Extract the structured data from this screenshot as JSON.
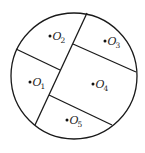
{
  "diagram": {
    "title": "",
    "canvas": {
      "width": 145,
      "height": 153,
      "background": "#ffffff"
    },
    "stroke_color": "#1a1a1a",
    "circle": {
      "cx": 74,
      "cy": 76,
      "r": 63
    },
    "partitions": [
      {
        "id": "main-diagonal",
        "x1": 35,
        "y1": 125,
        "x2": 87,
        "y2": 13
      },
      {
        "id": "o1-o2-divider",
        "x1": 16,
        "y1": 49,
        "x2": 60,
        "y2": 70
      },
      {
        "id": "o3-o4-divider",
        "x1": 73,
        "y1": 44,
        "x2": 136,
        "y2": 72
      },
      {
        "id": "o4-o5-divider",
        "x1": 49,
        "y1": 95,
        "x2": 112,
        "y2": 125
      }
    ],
    "regions": [
      {
        "id": "O1",
        "letter": "O",
        "subscript": "1",
        "dot": {
          "x": 30,
          "y": 82
        }
      },
      {
        "id": "O2",
        "letter": "O",
        "subscript": "2",
        "dot": {
          "x": 50,
          "y": 36
        }
      },
      {
        "id": "O3",
        "letter": "O",
        "subscript": "3",
        "dot": {
          "x": 105,
          "y": 41
        }
      },
      {
        "id": "O4",
        "letter": "O",
        "subscript": "4",
        "dot": {
          "x": 93,
          "y": 84
        }
      },
      {
        "id": "O5",
        "letter": "O",
        "subscript": "5",
        "dot": {
          "x": 67,
          "y": 120
        }
      }
    ]
  }
}
